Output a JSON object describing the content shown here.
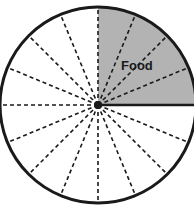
{
  "chart_data": {
    "type": "pie",
    "title": "",
    "total_slices": 16,
    "slice_style": "dashed spokes dividing circle into equal sixteenths",
    "segments": [
      {
        "label": "Food",
        "slices": 4,
        "fraction": 0.25,
        "percent": 25,
        "start_deg": 0,
        "end_deg": 90,
        "color": "#b3b3b3"
      },
      {
        "label": "",
        "slices": 12,
        "fraction": 0.75,
        "percent": 75,
        "start_deg": 90,
        "end_deg": 360,
        "color": "#ffffff"
      }
    ]
  },
  "diagram": {
    "center": {
      "x": 98,
      "y": 105
    },
    "radius": 98,
    "colors": {
      "outline": "#1a1a1a",
      "shaded": "#b3b3b3",
      "unshaded": "#ffffff",
      "spoke": "#1a1a1a"
    },
    "labels": {
      "food": "Food"
    }
  }
}
